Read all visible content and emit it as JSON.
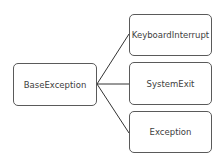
{
  "diagram": {
    "type": "hierarchy",
    "root": {
      "label": "BaseException"
    },
    "children": [
      {
        "label": "KeyboardInterrupt"
      },
      {
        "label": "SystemExit"
      },
      {
        "label": "Exception"
      }
    ],
    "edges": [
      {
        "from": "BaseException",
        "to": "KeyboardInterrupt"
      },
      {
        "from": "BaseException",
        "to": "SystemExit"
      },
      {
        "from": "BaseException",
        "to": "Exception"
      }
    ],
    "colors": {
      "border": "#5a5a5a",
      "text": "#404040",
      "line": "#333333",
      "background": "#ffffff"
    }
  }
}
